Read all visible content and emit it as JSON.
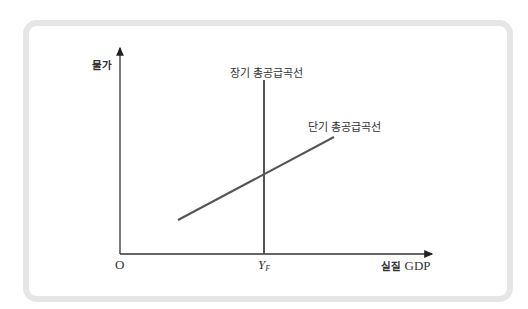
{
  "diagram": {
    "y_axis_label": "물가",
    "x_axis_label_kr": "실질",
    "x_axis_label_en": "GDP",
    "origin_label": "O",
    "yf_label_main": "Y",
    "yf_label_sub": "F",
    "lras_label": "장기 총공급곡선",
    "sras_label": "단기 총공급곡선",
    "colors": {
      "line": "#555555",
      "frame": "#e6e6e6",
      "axis": "#333333"
    }
  }
}
